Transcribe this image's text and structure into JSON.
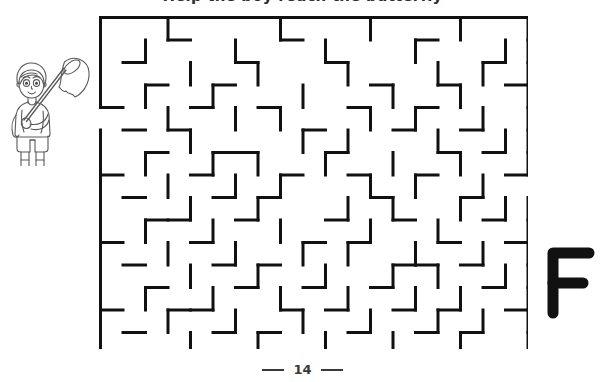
{
  "page": {
    "title_clipped": "Help the boy reach the butterfly",
    "background_color": "#ffffff",
    "ink_color": "#111111",
    "width": 605,
    "height": 382
  },
  "illustration": {
    "name": "boy-with-butterfly-net",
    "description": "Line art of a boy holding a butterfly net over his shoulder",
    "style": "coloring-book outline",
    "stroke_color": "#555555"
  },
  "letter_mark": {
    "character": "F",
    "color": "#111111"
  },
  "maze": {
    "name": "rectangular-grid-maze",
    "cols": 19,
    "rows": 15,
    "cell_size": 22.5,
    "wall_color": "#111111",
    "wall_thickness": 3,
    "entrance": {
      "side": "left",
      "row": 5
    },
    "exit": {
      "side": "right",
      "row": 9
    },
    "h_walls": [
      "1111111111111111111",
      "0001000010000010000",
      "0100001000100000010",
      "0010010000001001001",
      "1000100100010010000",
      "0101000001000100100",
      "0010011000100001010",
      "1000100010010010001",
      "0100010100001000100",
      "0011001000100100010",
      "1000100001010001001",
      "0100010100000110100",
      "0010001001001000010",
      "1001100010100101001",
      "0100010100010010100",
      "1111111111111111111"
    ],
    "v_walls": [
      "10010000100010001001",
      "10100010001000100011",
      "10001001000100010101",
      "10100100010001001001",
      "00010010100010100101",
      "10001000010100010011",
      "10100101001001001001",
      "10010010100010100100",
      "10001001000101001011",
      "10100100100010010001",
      "10010010010100100101",
      "10001001001001010011",
      "10100100100100101001",
      "10010010010010010101",
      "10001001001001001001"
    ]
  },
  "footer": {
    "page_number": "14",
    "dash_left": "—",
    "dash_right": "—"
  }
}
